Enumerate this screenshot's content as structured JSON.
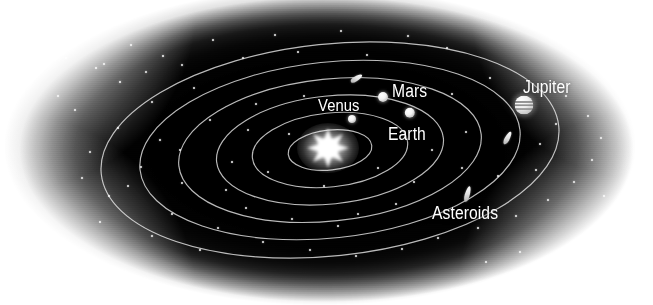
{
  "figure": {
    "type": "astronomical-diagram",
    "width": 653,
    "height": 305,
    "background_color": "#ffffff",
    "space_color": "#000000",
    "ink_color": "#ffffff"
  },
  "labels": [
    {
      "id": "venus",
      "text": "Venus",
      "x": 318,
      "y": 96,
      "font_size": 17
    },
    {
      "id": "mars",
      "text": "Mars",
      "x": 392,
      "y": 81,
      "font_size": 18
    },
    {
      "id": "earth",
      "text": "Earth",
      "x": 388,
      "y": 124,
      "font_size": 18
    },
    {
      "id": "jupiter",
      "text": "Jupiter",
      "x": 523,
      "y": 77,
      "font_size": 18
    },
    {
      "id": "asteroids",
      "text": "Asteroids",
      "x": 432,
      "y": 203,
      "font_size": 18
    }
  ],
  "sun": {
    "name": "Sun",
    "cx": 328,
    "cy": 148,
    "core_radius": 13,
    "glow_radius": 31,
    "ray_count": 8,
    "color": "#ffffff"
  },
  "orbits": [
    {
      "name": "Mercury orbit",
      "cx": 330,
      "cy": 150,
      "rx": 42,
      "ry": 20,
      "rotation": -6
    },
    {
      "name": "Venus orbit",
      "cx": 330,
      "cy": 150,
      "rx": 78,
      "ry": 37,
      "rotation": -6
    },
    {
      "name": "Earth orbit",
      "cx": 330,
      "cy": 150,
      "rx": 114,
      "ry": 54,
      "rotation": -6
    },
    {
      "name": "Mars orbit",
      "cx": 330,
      "cy": 150,
      "rx": 152,
      "ry": 71,
      "rotation": -6
    },
    {
      "name": "Asteroid belt",
      "cx": 330,
      "cy": 150,
      "rx": 191,
      "ry": 88,
      "rotation": -6
    },
    {
      "name": "Jupiter orbit",
      "cx": 330,
      "cy": 150,
      "rx": 230,
      "ry": 106,
      "rotation": -6
    }
  ],
  "bodies": [
    {
      "name": "Venus",
      "cx": 352,
      "cy": 119,
      "r": 4.0,
      "style": "dot"
    },
    {
      "name": "Earth",
      "cx": 410,
      "cy": 113,
      "r": 5.2,
      "style": "dot"
    },
    {
      "name": "Mars",
      "cx": 383,
      "cy": 97,
      "r": 5.0,
      "style": "dot"
    },
    {
      "name": "Jupiter",
      "cx": 524,
      "cy": 105,
      "r": 9.5,
      "style": "banded-sphere"
    }
  ],
  "asteroid_marks": [
    {
      "name": "asteroid-upper",
      "cx": 356,
      "cy": 78,
      "w": 5,
      "h": 13,
      "rotation": 58
    },
    {
      "name": "asteroid-right",
      "cx": 507,
      "cy": 138,
      "w": 5,
      "h": 14,
      "rotation": 28
    },
    {
      "name": "asteroid-lower",
      "cx": 467,
      "cy": 194,
      "w": 5,
      "h": 16,
      "rotation": 16
    }
  ],
  "stars": [
    {
      "x": 131,
      "y": 45,
      "r": 1.0
    },
    {
      "x": 163,
      "y": 56,
      "r": 1.2
    },
    {
      "x": 213,
      "y": 40,
      "r": 0.9
    },
    {
      "x": 275,
      "y": 35,
      "r": 1.0
    },
    {
      "x": 341,
      "y": 31,
      "r": 0.9
    },
    {
      "x": 408,
      "y": 36,
      "r": 1.0
    },
    {
      "x": 447,
      "y": 48,
      "r": 0.8
    },
    {
      "x": 96,
      "y": 68,
      "r": 1.1
    },
    {
      "x": 120,
      "y": 82,
      "r": 1.3
    },
    {
      "x": 58,
      "y": 96,
      "r": 1.0
    },
    {
      "x": 75,
      "y": 110,
      "r": 0.9
    },
    {
      "x": 66,
      "y": 58,
      "r": 1.1
    },
    {
      "x": 104,
      "y": 64,
      "r": 1.0
    },
    {
      "x": 146,
      "y": 72,
      "r": 0.9
    },
    {
      "x": 182,
      "y": 65,
      "r": 1.0
    },
    {
      "x": 243,
      "y": 58,
      "r": 0.9
    },
    {
      "x": 298,
      "y": 52,
      "r": 0.8
    },
    {
      "x": 367,
      "y": 55,
      "r": 0.9
    },
    {
      "x": 152,
      "y": 102,
      "r": 1.0
    },
    {
      "x": 194,
      "y": 88,
      "r": 0.9
    },
    {
      "x": 118,
      "y": 128,
      "r": 1.1
    },
    {
      "x": 160,
      "y": 140,
      "r": 1.0
    },
    {
      "x": 90,
      "y": 152,
      "r": 0.9
    },
    {
      "x": 210,
      "y": 120,
      "r": 0.8
    },
    {
      "x": 256,
      "y": 104,
      "r": 0.9
    },
    {
      "x": 141,
      "y": 167,
      "r": 1.0
    },
    {
      "x": 182,
      "y": 183,
      "r": 0.9
    },
    {
      "x": 109,
      "y": 196,
      "r": 1.0
    },
    {
      "x": 232,
      "y": 162,
      "r": 0.8
    },
    {
      "x": 289,
      "y": 134,
      "r": 0.8
    },
    {
      "x": 172,
      "y": 214,
      "r": 1.1
    },
    {
      "x": 218,
      "y": 228,
      "r": 1.0
    },
    {
      "x": 263,
      "y": 242,
      "r": 1.0
    },
    {
      "x": 310,
      "y": 250,
      "r": 0.9
    },
    {
      "x": 356,
      "y": 256,
      "r": 1.0
    },
    {
      "x": 402,
      "y": 249,
      "r": 0.9
    },
    {
      "x": 246,
      "y": 208,
      "r": 0.8
    },
    {
      "x": 292,
      "y": 219,
      "r": 0.9
    },
    {
      "x": 338,
      "y": 226,
      "r": 0.8
    },
    {
      "x": 438,
      "y": 238,
      "r": 1.0
    },
    {
      "x": 478,
      "y": 228,
      "r": 1.1
    },
    {
      "x": 516,
      "y": 216,
      "r": 1.0
    },
    {
      "x": 548,
      "y": 200,
      "r": 0.9
    },
    {
      "x": 574,
      "y": 182,
      "r": 1.0
    },
    {
      "x": 592,
      "y": 160,
      "r": 0.9
    },
    {
      "x": 601,
      "y": 138,
      "r": 1.0
    },
    {
      "x": 588,
      "y": 116,
      "r": 0.9
    },
    {
      "x": 566,
      "y": 96,
      "r": 0.8
    },
    {
      "x": 462,
      "y": 168,
      "r": 0.9
    },
    {
      "x": 498,
      "y": 176,
      "r": 0.8
    },
    {
      "x": 432,
      "y": 150,
      "r": 0.7
    },
    {
      "x": 466,
      "y": 132,
      "r": 0.7
    },
    {
      "x": 378,
      "y": 168,
      "r": 0.8
    },
    {
      "x": 324,
      "y": 186,
      "r": 0.8
    },
    {
      "x": 268,
      "y": 172,
      "r": 0.7
    },
    {
      "x": 396,
      "y": 204,
      "r": 0.8
    },
    {
      "x": 540,
      "y": 144,
      "r": 0.9
    },
    {
      "x": 556,
      "y": 124,
      "r": 0.8
    },
    {
      "x": 520,
      "y": 252,
      "r": 0.9
    },
    {
      "x": 486,
      "y": 262,
      "r": 0.8
    },
    {
      "x": 200,
      "y": 250,
      "r": 0.8
    },
    {
      "x": 152,
      "y": 236,
      "r": 0.9
    },
    {
      "x": 82,
      "y": 178,
      "r": 0.9
    },
    {
      "x": 100,
      "y": 222,
      "r": 0.8
    },
    {
      "x": 604,
      "y": 196,
      "r": 0.8
    },
    {
      "x": 358,
      "y": 214,
      "r": 0.7
    },
    {
      "x": 414,
      "y": 182,
      "r": 0.7
    },
    {
      "x": 536,
      "y": 170,
      "r": 0.8
    },
    {
      "x": 248,
      "y": 130,
      "r": 0.7
    },
    {
      "x": 304,
      "y": 96,
      "r": 0.7
    },
    {
      "x": 180,
      "y": 150,
      "r": 0.7
    },
    {
      "x": 452,
      "y": 94,
      "r": 0.8
    },
    {
      "x": 490,
      "y": 78,
      "r": 0.8
    },
    {
      "x": 128,
      "y": 186,
      "r": 0.8
    },
    {
      "x": 226,
      "y": 190,
      "r": 0.7
    }
  ]
}
